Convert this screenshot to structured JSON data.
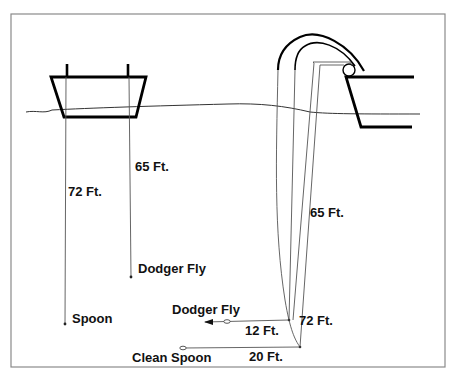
{
  "diagram": {
    "left_boat": {
      "labels": {
        "line_spoon_depth": "72 Ft.",
        "line_dodger_depth": "65 Ft.",
        "lure_dodger": "Dodger Fly",
        "lure_spoon": "Spoon"
      }
    },
    "right_boat": {
      "labels": {
        "line_65": "65 Ft.",
        "line_72": "72 Ft.",
        "lure_dodger": "Dodger Fly",
        "lure_clean_spoon": "Clean Spoon",
        "lead_12": "12 Ft.",
        "lead_20": "20 Ft."
      }
    },
    "colors": {
      "background": "#ffffff",
      "frame": "#8a8a8a",
      "lines": "#555555",
      "boat": "#000000"
    }
  }
}
